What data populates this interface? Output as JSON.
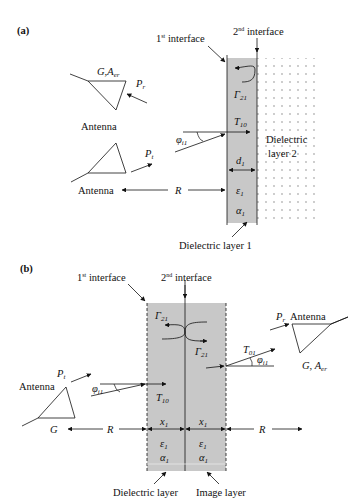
{
  "panel_a": {
    "label": "(a)",
    "first_interface": {
      "num": "1",
      "sup": "st",
      "text": " interface"
    },
    "second_interface": {
      "num": "2",
      "sup": "nd",
      "text": " interface"
    },
    "rx_antenna": {
      "label": "Antenna",
      "params_main": "G,A",
      "params_sub": "er",
      "power_main": "P",
      "power_sub": "r"
    },
    "tx_antenna": {
      "label": "Antenna",
      "power_main": "P",
      "power_sub": "t"
    },
    "angle": {
      "main": "φ",
      "sub": "i1"
    },
    "reflection": {
      "main": "Γ",
      "sub": "21"
    },
    "transmission": {
      "main": "T",
      "sub": "10"
    },
    "thickness": {
      "main": "d",
      "sub": "1"
    },
    "permittivity": {
      "main": "ε",
      "sub": "1"
    },
    "attenuation": {
      "main": "α",
      "sub": "1"
    },
    "distance": "R",
    "layer2_label_line1": "Dielectric",
    "layer2_label_line2": "layer 2",
    "layer1_label": "Dielectric layer 1",
    "colors": {
      "layer1_fill": "#c8c8c8",
      "dots": "#777777",
      "line": "#111111"
    }
  },
  "panel_b": {
    "label": "(b)",
    "first_interface": {
      "num": "1",
      "sup": "st",
      "text": " interface"
    },
    "second_interface": {
      "num": "2",
      "sup": "nd",
      "text": " interface"
    },
    "tx_antenna": {
      "label": "Antenna",
      "gain": "G",
      "power_main": "P",
      "power_sub": "t"
    },
    "rx_antenna": {
      "label": "Antenna",
      "params_main": "G, A",
      "params_sub": "er",
      "power_main": "P",
      "power_sub": "r"
    },
    "angle": {
      "main": "φ",
      "sub": "i1"
    },
    "reflection_top": {
      "main": "Γ",
      "sub": "21"
    },
    "reflection_bottom": {
      "main": "Γ",
      "sub": "21"
    },
    "transmission_in": {
      "main": "T",
      "sub": "10"
    },
    "transmission_out": {
      "main": "T",
      "sub": "01"
    },
    "thickness_left": {
      "main": "x",
      "sub": "1"
    },
    "thickness_right": {
      "main": "x",
      "sub": "1"
    },
    "permittivity": {
      "main": "ε",
      "sub": "1"
    },
    "attenuation": {
      "main": "α",
      "sub": "1"
    },
    "distance_left": "R",
    "distance_right": "R",
    "dielectric_label": "Dielectric layer",
    "image_label": "Image layer",
    "colors": {
      "layer_fill": "#c8c8c8",
      "line": "#111111"
    }
  }
}
